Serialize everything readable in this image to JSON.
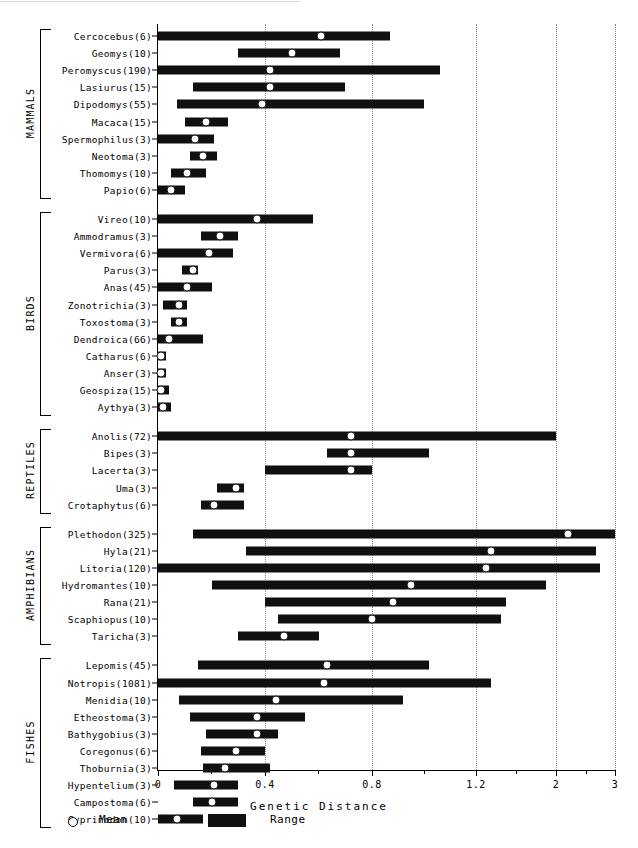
{
  "axis": {
    "xlabel": "Genetic Distance",
    "ticks": [
      {
        "value": 0,
        "label": "0",
        "px": 158
      },
      {
        "value": 0.4,
        "label": "0.4",
        "px": 265
      },
      {
        "value": 0.8,
        "label": "0.8",
        "px": 372
      },
      {
        "value": 1.2,
        "label": "1.2",
        "px": 476
      },
      {
        "value": 2,
        "label": "2",
        "px": 556
      },
      {
        "value": 3,
        "label": "3",
        "px": 615
      }
    ],
    "minor_ticks_px": [
      211,
      318,
      424,
      516,
      586
    ],
    "gridlines_px": [
      265,
      372,
      476,
      556,
      615
    ],
    "grid": true
  },
  "legend": {
    "mean_label": "Mean",
    "range_label": "Range",
    "mean_symbol": "open-circle",
    "range_symbol": "filled-bar"
  },
  "groups": [
    {
      "name": "MAMMALS",
      "taxa": [
        {
          "label": "Cercocebus(6)",
          "genus": "Cercocebus",
          "n": 6,
          "min": 0.0,
          "max": 0.87,
          "mean": 0.61
        },
        {
          "label": "Geomys(10)",
          "genus": "Geomys",
          "n": 10,
          "min": 0.3,
          "max": 0.68,
          "mean": 0.5
        },
        {
          "label": "Peromyscus(190)",
          "genus": "Peromyscus",
          "n": 190,
          "min": 0.0,
          "max": 1.06,
          "mean": 0.42
        },
        {
          "label": "Lasiurus(15)",
          "genus": "Lasiurus",
          "n": 15,
          "min": 0.13,
          "max": 0.7,
          "mean": 0.42
        },
        {
          "label": "Dipodomys(55)",
          "genus": "Dipodomys",
          "n": 55,
          "min": 0.07,
          "max": 1.0,
          "mean": 0.39
        },
        {
          "label": "Macaca(15)",
          "genus": "Macaca",
          "n": 15,
          "min": 0.1,
          "max": 0.26,
          "mean": 0.18
        },
        {
          "label": "Spermophilus(3)",
          "genus": "Spermophilus",
          "n": 3,
          "min": 0.0,
          "max": 0.21,
          "mean": 0.14
        },
        {
          "label": "Neotoma(3)",
          "genus": "Neotoma",
          "n": 3,
          "min": 0.12,
          "max": 0.22,
          "mean": 0.17
        },
        {
          "label": "Thomomys(10)",
          "genus": "Thomomys",
          "n": 10,
          "min": 0.05,
          "max": 0.18,
          "mean": 0.11
        },
        {
          "label": "Papio(6)",
          "genus": "Papio",
          "n": 6,
          "min": 0.0,
          "max": 0.1,
          "mean": 0.05
        }
      ]
    },
    {
      "name": "BIRDS",
      "taxa": [
        {
          "label": "Vireo(10)",
          "genus": "Vireo",
          "n": 10,
          "min": 0.0,
          "max": 0.58,
          "mean": 0.37
        },
        {
          "label": "Ammodramus(3)",
          "genus": "Ammodramus",
          "n": 3,
          "min": 0.16,
          "max": 0.3,
          "mean": 0.23
        },
        {
          "label": "Vermivora(6)",
          "genus": "Vermivora",
          "n": 6,
          "min": 0.0,
          "max": 0.28,
          "mean": 0.19
        },
        {
          "label": "Parus(3)",
          "genus": "Parus",
          "n": 3,
          "min": 0.09,
          "max": 0.15,
          "mean": 0.13
        },
        {
          "label": "Anas(45)",
          "genus": "Anas",
          "n": 45,
          "min": 0.0,
          "max": 0.2,
          "mean": 0.11
        },
        {
          "label": "Zonotrichia(3)",
          "genus": "Zonotrichia",
          "n": 3,
          "min": 0.02,
          "max": 0.11,
          "mean": 0.08
        },
        {
          "label": "Toxostoma(3)",
          "genus": "Toxostoma",
          "n": 3,
          "min": 0.05,
          "max": 0.11,
          "mean": 0.08
        },
        {
          "label": "Dendroica(66)",
          "genus": "Dendroica",
          "n": 66,
          "min": 0.0,
          "max": 0.17,
          "mean": 0.04
        },
        {
          "label": "Catharus(6)",
          "genus": "Catharus",
          "n": 6,
          "min": 0.0,
          "max": 0.03,
          "mean": 0.01
        },
        {
          "label": "Anser(3)",
          "genus": "Anser",
          "n": 3,
          "min": 0.0,
          "max": 0.03,
          "mean": 0.01
        },
        {
          "label": "Geospiza(15)",
          "genus": "Geospiza",
          "n": 15,
          "min": 0.0,
          "max": 0.04,
          "mean": 0.01
        },
        {
          "label": "Aythya(3)",
          "genus": "Aythya",
          "n": 3,
          "min": 0.0,
          "max": 0.05,
          "mean": 0.02
        }
      ]
    },
    {
      "name": "REPTILES",
      "taxa": [
        {
          "label": "Anolis(72)",
          "genus": "Anolis",
          "n": 72,
          "min": 0.0,
          "max": 2.0,
          "mean": 0.72
        },
        {
          "label": "Bipes(3)",
          "genus": "Bipes",
          "n": 3,
          "min": 0.63,
          "max": 1.02,
          "mean": 0.72
        },
        {
          "label": "Lacerta(3)",
          "genus": "Lacerta",
          "n": 3,
          "min": 0.4,
          "max": 0.8,
          "mean": 0.72
        },
        {
          "label": "Uma(3)",
          "genus": "Uma",
          "n": 3,
          "min": 0.22,
          "max": 0.32,
          "mean": 0.29
        },
        {
          "label": "Crotaphytus(6)",
          "genus": "Crotaphytus",
          "n": 6,
          "min": 0.16,
          "max": 0.32,
          "mean": 0.21
        }
      ]
    },
    {
      "name": "AMPHIBIANS",
      "taxa": [
        {
          "label": "Plethodon(325)",
          "genus": "Plethodon",
          "n": 325,
          "min": 0.13,
          "max": 3.0,
          "mean": 2.2
        },
        {
          "label": "Hyla(21)",
          "genus": "Hyla",
          "n": 21,
          "min": 0.33,
          "max": 2.67,
          "mean": 1.35
        },
        {
          "label": "Litoria(120)",
          "genus": "Litoria",
          "n": 120,
          "min": 0.0,
          "max": 2.75,
          "mean": 1.3
        },
        {
          "label": "Hydromantes(10)",
          "genus": "Hydromantes",
          "n": 10,
          "min": 0.2,
          "max": 1.9,
          "mean": 0.95
        },
        {
          "label": "Rana(21)",
          "genus": "Rana",
          "n": 21,
          "min": 0.4,
          "max": 1.5,
          "mean": 0.88
        },
        {
          "label": "Scaphiopus(10)",
          "genus": "Scaphiopus",
          "n": 10,
          "min": 0.45,
          "max": 1.45,
          "mean": 0.8
        },
        {
          "label": "Taricha(3)",
          "genus": "Taricha",
          "n": 3,
          "min": 0.3,
          "max": 0.6,
          "mean": 0.47
        }
      ]
    },
    {
      "name": "FISHES",
      "taxa": [
        {
          "label": "Lepomis(45)",
          "genus": "Lepomis",
          "n": 45,
          "min": 0.15,
          "max": 1.02,
          "mean": 0.63
        },
        {
          "label": "Notropis(1081)",
          "genus": "Notropis",
          "n": 1081,
          "min": 0.0,
          "max": 1.35,
          "mean": 0.62
        },
        {
          "label": "Menidia(10)",
          "genus": "Menidia",
          "n": 10,
          "min": 0.08,
          "max": 0.92,
          "mean": 0.44
        },
        {
          "label": "Etheostoma(3)",
          "genus": "Etheostoma",
          "n": 3,
          "min": 0.12,
          "max": 0.55,
          "mean": 0.37
        },
        {
          "label": "Bathygobius(3)",
          "genus": "Bathygobius",
          "n": 3,
          "min": 0.18,
          "max": 0.45,
          "mean": 0.37
        },
        {
          "label": "Coregonus(6)",
          "genus": "Coregonus",
          "n": 6,
          "min": 0.16,
          "max": 0.4,
          "mean": 0.29
        },
        {
          "label": "Thoburnia(3)",
          "genus": "Thoburnia",
          "n": 3,
          "min": 0.17,
          "max": 0.42,
          "mean": 0.25
        },
        {
          "label": "Hypentelium(3)",
          "genus": "Hypentelium",
          "n": 3,
          "min": 0.06,
          "max": 0.3,
          "mean": 0.21
        },
        {
          "label": "Campostoma(6)",
          "genus": "Campostoma",
          "n": 6,
          "min": 0.13,
          "max": 0.3,
          "mean": 0.2
        },
        {
          "label": "Cyprinodon(10)",
          "genus": "Cyprinodon",
          "n": 10,
          "min": 0.0,
          "max": 0.17,
          "mean": 0.07
        }
      ]
    }
  ],
  "chart_data": {
    "type": "bar",
    "title": "",
    "subtitle": "",
    "xlabel": "Genetic Distance",
    "ylabel": "",
    "xlim": [
      0,
      3
    ],
    "x_scale": "piecewise-linear",
    "grid": true,
    "legend_position": "bottom-left",
    "legend": [
      "Mean",
      "Range"
    ],
    "xticks": [
      0,
      0.4,
      0.8,
      1.2,
      2,
      3
    ],
    "xticklabels": [
      "0",
      "0.4",
      "0.8",
      "1.2",
      "2",
      "3"
    ],
    "categories": [
      "Cercocebus(6)",
      "Geomys(10)",
      "Peromyscus(190)",
      "Lasiurus(15)",
      "Dipodomys(55)",
      "Macaca(15)",
      "Spermophilus(3)",
      "Neotoma(3)",
      "Thomomys(10)",
      "Papio(6)",
      "Vireo(10)",
      "Ammodramus(3)",
      "Vermivora(6)",
      "Parus(3)",
      "Anas(45)",
      "Zonotrichia(3)",
      "Toxostoma(3)",
      "Dendroica(66)",
      "Catharus(6)",
      "Anser(3)",
      "Geospiza(15)",
      "Aythya(3)",
      "Anolis(72)",
      "Bipes(3)",
      "Lacerta(3)",
      "Uma(3)",
      "Crotaphytus(6)",
      "Plethodon(325)",
      "Hyla(21)",
      "Litoria(120)",
      "Hydromantes(10)",
      "Rana(21)",
      "Scaphiopus(10)",
      "Taricha(3)",
      "Lepomis(45)",
      "Notropis(1081)",
      "Menidia(10)",
      "Etheostoma(3)",
      "Bathygobius(3)",
      "Coregonus(6)",
      "Thoburnia(3)",
      "Hypentelium(3)",
      "Campostoma(6)",
      "Cyprinodon(10)"
    ],
    "series": [
      {
        "name": "Range min",
        "values": [
          0.0,
          0.3,
          0.0,
          0.13,
          0.07,
          0.1,
          0.0,
          0.12,
          0.05,
          0.0,
          0.0,
          0.16,
          0.0,
          0.09,
          0.0,
          0.02,
          0.05,
          0.0,
          0.0,
          0.0,
          0.0,
          0.0,
          0.0,
          0.63,
          0.4,
          0.22,
          0.16,
          0.13,
          0.33,
          0.0,
          0.2,
          0.4,
          0.45,
          0.3,
          0.15,
          0.0,
          0.08,
          0.12,
          0.18,
          0.16,
          0.17,
          0.06,
          0.13,
          0.0
        ]
      },
      {
        "name": "Range max",
        "values": [
          0.87,
          0.68,
          1.06,
          0.7,
          1.0,
          0.26,
          0.21,
          0.22,
          0.18,
          0.1,
          0.58,
          0.3,
          0.28,
          0.15,
          0.2,
          0.11,
          0.11,
          0.17,
          0.03,
          0.03,
          0.04,
          0.05,
          2.0,
          1.02,
          0.8,
          0.32,
          0.32,
          3.0,
          2.67,
          2.75,
          1.9,
          1.5,
          1.45,
          0.6,
          1.02,
          1.35,
          0.92,
          0.55,
          0.45,
          0.4,
          0.42,
          0.3,
          0.3,
          0.17
        ]
      },
      {
        "name": "Mean",
        "values": [
          0.61,
          0.5,
          0.42,
          0.42,
          0.39,
          0.18,
          0.14,
          0.17,
          0.11,
          0.05,
          0.37,
          0.23,
          0.19,
          0.13,
          0.11,
          0.08,
          0.08,
          0.04,
          0.01,
          0.01,
          0.01,
          0.02,
          0.72,
          0.72,
          0.72,
          0.29,
          0.21,
          2.2,
          1.35,
          1.3,
          0.95,
          0.88,
          0.8,
          0.47,
          0.63,
          0.62,
          0.44,
          0.37,
          0.37,
          0.29,
          0.25,
          0.21,
          0.2,
          0.07
        ]
      }
    ],
    "group_labels": [
      "MAMMALS",
      "BIRDS",
      "REPTILES",
      "AMPHIBIANS",
      "FISHES"
    ]
  }
}
